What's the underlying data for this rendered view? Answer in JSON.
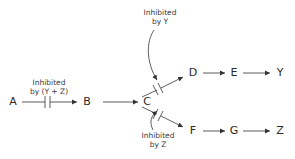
{
  "diagram": {
    "type": "metabolic pathway with feedback inhibition",
    "nodes": {
      "A": "A",
      "B": "B",
      "C": "C",
      "D": "D",
      "E": "E",
      "Y": "Y",
      "F": "F",
      "G": "G",
      "Z": "Z"
    },
    "edges": [
      {
        "from": "A",
        "to": "B",
        "inhibited_by": "Y + Z"
      },
      {
        "from": "B",
        "to": "C"
      },
      {
        "from": "C",
        "to": "D",
        "inhibited_by": "Y"
      },
      {
        "from": "D",
        "to": "E"
      },
      {
        "from": "E",
        "to": "Y"
      },
      {
        "from": "C",
        "to": "F",
        "inhibited_by": "Z"
      },
      {
        "from": "F",
        "to": "G"
      },
      {
        "from": "G",
        "to": "Z"
      }
    ],
    "labels": {
      "ab": {
        "line1": "Inhibited",
        "line2": "by (Y + Z)"
      },
      "cd": {
        "line1": "Inhibited",
        "line2": "by Y"
      },
      "cf": {
        "line1": "Inhibited",
        "line2": "by Z"
      }
    },
    "colors": {
      "line": "#333333",
      "text": "#2a2a2a",
      "background": "#ffffff"
    }
  }
}
